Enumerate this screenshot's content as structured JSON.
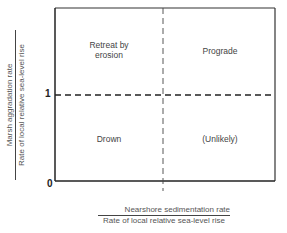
{
  "diagram": {
    "y_axis": {
      "numerator": "Marsh aggradation rate",
      "denominator": "Rate of local relative sea-level rise",
      "ticks": [
        "1",
        "0"
      ]
    },
    "x_axis": {
      "numerator": "Nearshore sedimentation rate",
      "denominator": "Rate of local relative sea-level rise"
    },
    "quadrants": {
      "top_left": [
        "Retreat by",
        "erosion"
      ],
      "top_right": "Prograde",
      "bottom_left": "Drown",
      "bottom_right": "(Unlikely)"
    },
    "colors": {
      "line": "#333333",
      "text": "#444444"
    }
  }
}
